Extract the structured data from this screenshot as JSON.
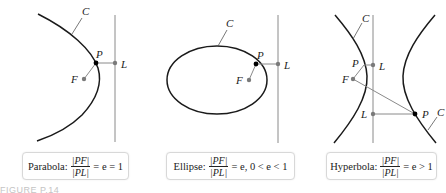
{
  "figure": {
    "caption": "FIGURE P.14",
    "panels": [
      {
        "name": "parabola",
        "labels": {
          "curve": "C",
          "point": "P",
          "focus": "F",
          "directrix_point": "L"
        },
        "box": {
          "title": "Parabola:",
          "numerator": "|PF|",
          "denominator": "|PL|",
          "relation": "= e = 1"
        }
      },
      {
        "name": "ellipse",
        "labels": {
          "curve": "C",
          "point": "P",
          "focus": "F",
          "directrix_point": "L"
        },
        "box": {
          "title": "Ellipse:",
          "numerator": "|PF|",
          "denominator": "|PL|",
          "relation": "= e, 0 < e < 1"
        }
      },
      {
        "name": "hyperbola",
        "labels": {
          "curve_left": "C",
          "curve_right": "C",
          "point_upper": "P",
          "point_lower": "P",
          "focus": "F",
          "directrix_point_upper": "L",
          "directrix_point_lower": "L"
        },
        "box": {
          "title": "Hyperbola:",
          "numerator": "|PF|",
          "denominator": "|PL|",
          "relation": "= e > 1"
        }
      }
    ],
    "colors": {
      "curve": "#1a1a1a",
      "line": "#8a8a8a",
      "point_dark": "#000000",
      "point_gray": "#7a7a7a",
      "caption": "#c4c4c4"
    }
  }
}
